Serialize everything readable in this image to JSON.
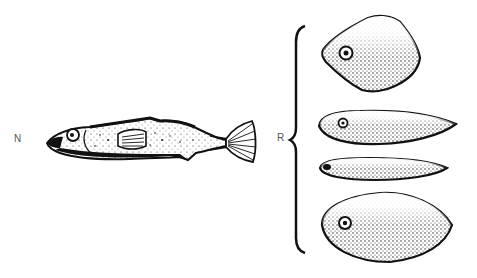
{
  "figure": {
    "labels": {
      "n": "N",
      "r": "R"
    },
    "groups": [
      {
        "id": "N",
        "description": "Naturalistic stickleback model",
        "items": 1
      },
      {
        "id": "R",
        "description": "Crude models grouped by brace",
        "items": 4
      }
    ],
    "colors": {
      "ink": "#111111",
      "background": "#ffffff",
      "label": "#555555"
    }
  }
}
